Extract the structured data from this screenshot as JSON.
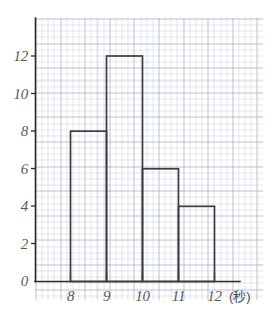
{
  "chart_data": {
    "type": "bar",
    "title": "",
    "subtitle": "",
    "xlabel": "",
    "ylabel": "",
    "unit_label": "(秒)",
    "categories": [
      "8-9",
      "9-10",
      "10-11",
      "11-12"
    ],
    "bin_edges": [
      8,
      9,
      10,
      11,
      12
    ],
    "values": [
      8,
      12,
      6,
      4
    ],
    "xlim": [
      7.5,
      12.5
    ],
    "ylim": [
      0,
      13
    ],
    "x_ticks": [
      "8",
      "9",
      "10",
      "11",
      "12"
    ],
    "x_tick_values": [
      8,
      9,
      10,
      11,
      12
    ],
    "y_ticks": [
      "0",
      "2",
      "4",
      "6",
      "8",
      "10",
      "12"
    ],
    "y_tick_values": [
      0,
      2,
      4,
      6,
      8,
      10,
      12
    ],
    "grid": true,
    "legend": false,
    "bar_fill": "#ffffff",
    "bar_stroke": "#3c3c3c",
    "axis_color": "#2b2b2b",
    "grid_color": "#aab2c8",
    "label_color": "#5a5a5a"
  }
}
